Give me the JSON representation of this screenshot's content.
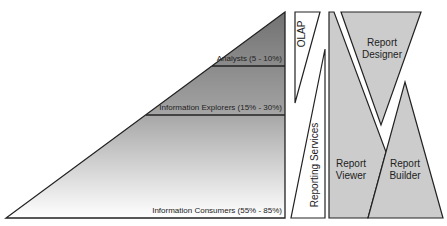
{
  "pyramid": {
    "tiers": [
      {
        "label": "Analysts (5 - 10%)"
      },
      {
        "label": "Information Explorers (15% - 30%)"
      },
      {
        "label": "Information Consumers (55% - 85%)"
      }
    ],
    "gradient_top": "#7a7a7a",
    "gradient_bottom": "#ffffff"
  },
  "tools": {
    "olap": "OLAP",
    "reporting_services": "Reporting Services",
    "report_designer": [
      "Report",
      "Designer"
    ],
    "report_viewer": [
      "Report",
      "Viewer"
    ],
    "report_builder": [
      "Report",
      "Builder"
    ],
    "fill": "#cccccc"
  }
}
